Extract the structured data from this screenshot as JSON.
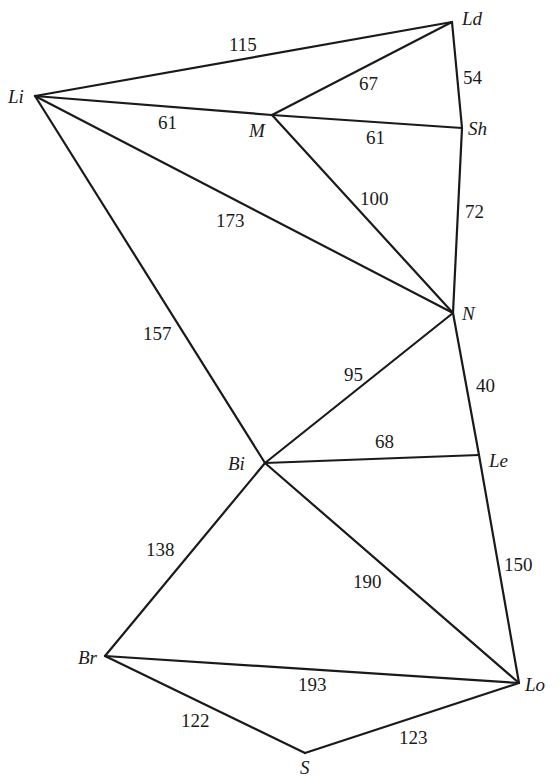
{
  "diagram": {
    "type": "weighted-undirected-graph",
    "nodes": [
      {
        "id": "Li",
        "label": "Li",
        "x": 35,
        "y": 96,
        "lx": 8,
        "ly": 103
      },
      {
        "id": "Ld",
        "label": "Ld",
        "x": 452,
        "y": 22,
        "lx": 462,
        "ly": 25
      },
      {
        "id": "M",
        "label": "M",
        "x": 272,
        "y": 115,
        "lx": 249,
        "ly": 137
      },
      {
        "id": "Sh",
        "label": "Sh",
        "x": 462,
        "y": 128,
        "lx": 468,
        "ly": 135
      },
      {
        "id": "N",
        "label": "N",
        "x": 453,
        "y": 313,
        "lx": 462,
        "ly": 320
      },
      {
        "id": "Bi",
        "label": "Bi",
        "x": 265,
        "y": 463,
        "lx": 228,
        "ly": 470
      },
      {
        "id": "Le",
        "label": "Le",
        "x": 479,
        "y": 455,
        "lx": 489,
        "ly": 467
      },
      {
        "id": "Br",
        "label": "Br",
        "x": 105,
        "y": 656,
        "lx": 78,
        "ly": 664
      },
      {
        "id": "Lo",
        "label": "Lo",
        "x": 519,
        "y": 683,
        "lx": 525,
        "ly": 691
      },
      {
        "id": "S",
        "label": "S",
        "x": 305,
        "y": 753,
        "lx": 300,
        "ly": 774
      }
    ],
    "edges": [
      {
        "from": "Li",
        "to": "Ld",
        "weight": "115",
        "lx": 229,
        "ly": 51
      },
      {
        "from": "Li",
        "to": "M",
        "weight": "61",
        "lx": 158,
        "ly": 129
      },
      {
        "from": "Li",
        "to": "N",
        "weight": "173",
        "lx": 216,
        "ly": 227
      },
      {
        "from": "Li",
        "to": "Bi",
        "weight": "157",
        "lx": 143,
        "ly": 340
      },
      {
        "from": "M",
        "to": "Ld",
        "weight": "67",
        "lx": 359,
        "ly": 90
      },
      {
        "from": "M",
        "to": "Sh",
        "weight": "61",
        "lx": 366,
        "ly": 144
      },
      {
        "from": "M",
        "to": "N",
        "weight": "100",
        "lx": 360,
        "ly": 205
      },
      {
        "from": "Ld",
        "to": "Sh",
        "weight": "54",
        "lx": 463,
        "ly": 84
      },
      {
        "from": "Sh",
        "to": "N",
        "weight": "72",
        "lx": 465,
        "ly": 218
      },
      {
        "from": "N",
        "to": "Bi",
        "weight": "95",
        "lx": 344,
        "ly": 381
      },
      {
        "from": "N",
        "to": "Le",
        "weight": "40",
        "lx": 476,
        "ly": 392
      },
      {
        "from": "Bi",
        "to": "Le",
        "weight": "68",
        "lx": 375,
        "ly": 448
      },
      {
        "from": "Bi",
        "to": "Br",
        "weight": "138",
        "lx": 146,
        "ly": 556
      },
      {
        "from": "Bi",
        "to": "Lo",
        "weight": "190",
        "lx": 353,
        "ly": 588
      },
      {
        "from": "Le",
        "to": "Lo",
        "weight": "150",
        "lx": 504,
        "ly": 571
      },
      {
        "from": "Br",
        "to": "Lo",
        "weight": "193",
        "lx": 298,
        "ly": 691
      },
      {
        "from": "Br",
        "to": "S",
        "weight": "122",
        "lx": 181,
        "ly": 727
      },
      {
        "from": "S",
        "to": "Lo",
        "weight": "123",
        "lx": 399,
        "ly": 744
      }
    ]
  }
}
